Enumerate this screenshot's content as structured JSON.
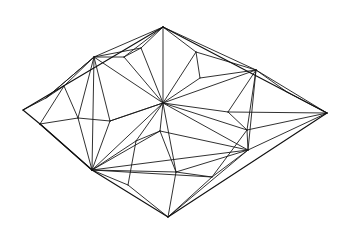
{
  "figure": {
    "kind": "line-drawing",
    "width": 350,
    "height": 240,
    "background_color": "#ffffff",
    "stroke_color": "#1a1a1a",
    "outline_stroke_color": "#111111",
    "stroke_width": 0.9,
    "outline_stroke_width": 1.15
  },
  "chart_data": {
    "type": "diagram",
    "subtype": "planar-graph-triangulation",
    "xlabel": "",
    "ylabel": "",
    "xlim": [
      0,
      350
    ],
    "ylim": [
      0,
      240
    ],
    "grid": false,
    "legend": null,
    "vertices": [
      {
        "id": "L",
        "name": "left-apex",
        "x": 23,
        "y": 110,
        "degree": 4,
        "role": "boundary-corner"
      },
      {
        "id": "T",
        "name": "top-apex",
        "x": 163,
        "y": 27,
        "degree": 8,
        "role": "boundary-corner"
      },
      {
        "id": "R",
        "name": "right-apex",
        "x": 327,
        "y": 113,
        "degree": 8,
        "role": "boundary-corner"
      },
      {
        "id": "B",
        "name": "bottom-apex",
        "x": 168,
        "y": 217,
        "degree": 5,
        "role": "boundary-corner"
      },
      {
        "id": "HUL",
        "name": "hub-upper-left",
        "x": 94,
        "y": 57,
        "degree": 14,
        "role": "hub"
      },
      {
        "id": "HC",
        "name": "hub-center",
        "x": 163,
        "y": 103,
        "degree": 22,
        "role": "hub"
      },
      {
        "id": "HLL",
        "name": "hub-lower-left",
        "x": 92,
        "y": 170,
        "degree": 18,
        "role": "hub"
      },
      {
        "id": "HR",
        "name": "hub-right",
        "x": 248,
        "y": 150,
        "degree": 16,
        "role": "hub"
      },
      {
        "id": "HUR",
        "name": "hub-upper-right",
        "x": 256,
        "y": 70,
        "degree": 10,
        "role": "hub"
      },
      {
        "id": "a1",
        "name": "node-upper-left-low",
        "x": 64,
        "y": 86,
        "degree": 5,
        "role": "interior"
      },
      {
        "id": "a2",
        "name": "node-left-mid",
        "x": 40,
        "y": 124,
        "degree": 4,
        "role": "boundary"
      },
      {
        "id": "a3",
        "name": "node-left-fan-a",
        "x": 78,
        "y": 118,
        "degree": 4,
        "role": "interior"
      },
      {
        "id": "a4",
        "name": "node-left-fan-b",
        "x": 110,
        "y": 121,
        "degree": 4,
        "role": "interior"
      },
      {
        "id": "a5",
        "name": "node-upper-mid-left",
        "x": 124,
        "y": 57,
        "degree": 4,
        "role": "interior"
      },
      {
        "id": "a6",
        "name": "node-upper-mid",
        "x": 141,
        "y": 48,
        "degree": 4,
        "role": "interior"
      },
      {
        "id": "a7",
        "name": "node-upper-right-mid",
        "x": 196,
        "y": 52,
        "degree": 4,
        "role": "interior"
      },
      {
        "id": "a8",
        "name": "node-upper-right-low",
        "x": 200,
        "y": 78,
        "degree": 5,
        "role": "interior"
      },
      {
        "id": "a9",
        "name": "node-center-low",
        "x": 160,
        "y": 131,
        "degree": 5,
        "role": "interior"
      },
      {
        "id": "a10",
        "name": "node-center-left-low",
        "x": 136,
        "y": 141,
        "degree": 4,
        "role": "interior"
      },
      {
        "id": "a11",
        "name": "node-bottom-left",
        "x": 128,
        "y": 185,
        "degree": 3,
        "role": "interior"
      },
      {
        "id": "a12",
        "name": "node-bottom-mid",
        "x": 176,
        "y": 172,
        "degree": 5,
        "role": "interior"
      },
      {
        "id": "a13",
        "name": "node-bottom-right",
        "x": 212,
        "y": 177,
        "degree": 4,
        "role": "interior"
      },
      {
        "id": "a14",
        "name": "node-right-narrow",
        "x": 247,
        "y": 130,
        "degree": 5,
        "role": "interior"
      },
      {
        "id": "a15",
        "name": "node-right-band-up",
        "x": 228,
        "y": 112,
        "degree": 4,
        "role": "interior"
      },
      {
        "id": "a16",
        "name": "node-right-upper-arm",
        "x": 287,
        "y": 92,
        "degree": 3,
        "role": "interior"
      },
      {
        "id": "a17",
        "name": "node-upper-left-edge",
        "x": 46,
        "y": 98,
        "degree": 3,
        "role": "interior"
      }
    ],
    "edges": [
      [
        "L",
        "T"
      ],
      [
        "T",
        "R"
      ],
      [
        "R",
        "B"
      ],
      [
        "B",
        "HLL"
      ],
      [
        "HLL",
        "a2"
      ],
      [
        "a2",
        "L"
      ],
      [
        "L",
        "a17"
      ],
      [
        "a17",
        "HUL"
      ],
      [
        "a17",
        "a1"
      ],
      [
        "a2",
        "a3"
      ],
      [
        "a2",
        "HLL"
      ],
      [
        "T",
        "HUL"
      ],
      [
        "T",
        "a5"
      ],
      [
        "T",
        "a6"
      ],
      [
        "T",
        "HC"
      ],
      [
        "T",
        "a7"
      ],
      [
        "T",
        "HUR"
      ],
      [
        "HUL",
        "a1"
      ],
      [
        "HUL",
        "a3"
      ],
      [
        "HUL",
        "a4"
      ],
      [
        "HUL",
        "a5"
      ],
      [
        "HUL",
        "a6"
      ],
      [
        "HUL",
        "HC"
      ],
      [
        "HUL",
        "HLL"
      ],
      [
        "HUL",
        "a17"
      ],
      [
        "a1",
        "a3"
      ],
      [
        "a1",
        "a2"
      ],
      [
        "a3",
        "a4"
      ],
      [
        "a3",
        "HLL"
      ],
      [
        "a4",
        "HLL"
      ],
      [
        "a4",
        "HC"
      ],
      [
        "a5",
        "a6"
      ],
      [
        "a6",
        "HC"
      ],
      [
        "a5",
        "HC"
      ],
      [
        "a7",
        "HUR"
      ],
      [
        "a7",
        "a8"
      ],
      [
        "a7",
        "HC"
      ],
      [
        "a8",
        "HC"
      ],
      [
        "a8",
        "HUR"
      ],
      [
        "HUR",
        "R"
      ],
      [
        "HUR",
        "a16"
      ],
      [
        "a16",
        "R"
      ],
      [
        "HUR",
        "a15"
      ],
      [
        "HUR",
        "HC"
      ],
      [
        "HUR",
        "a14"
      ],
      [
        "HUR",
        "HR"
      ],
      [
        "HC",
        "a15"
      ],
      [
        "HC",
        "a14"
      ],
      [
        "HC",
        "HR"
      ],
      [
        "HC",
        "a9"
      ],
      [
        "HC",
        "a10"
      ],
      [
        "HC",
        "a12"
      ],
      [
        "HC",
        "HLL"
      ],
      [
        "HC",
        "a4"
      ],
      [
        "a15",
        "a14"
      ],
      [
        "a15",
        "R"
      ],
      [
        "a14",
        "R"
      ],
      [
        "a14",
        "HR"
      ],
      [
        "a14",
        "a13"
      ],
      [
        "R",
        "HR"
      ],
      [
        "HR",
        "a13"
      ],
      [
        "HR",
        "a12"
      ],
      [
        "HR",
        "a9"
      ],
      [
        "HR",
        "HLL"
      ],
      [
        "HR",
        "B"
      ],
      [
        "a9",
        "a10"
      ],
      [
        "a9",
        "a12"
      ],
      [
        "a9",
        "HLL"
      ],
      [
        "a10",
        "HLL"
      ],
      [
        "a10",
        "a11"
      ],
      [
        "a11",
        "HLL"
      ],
      [
        "a11",
        "B"
      ],
      [
        "a12",
        "a13"
      ],
      [
        "a12",
        "B"
      ],
      [
        "a13",
        "B"
      ],
      [
        "HLL",
        "a12"
      ],
      [
        "HLL",
        "a13"
      ]
    ],
    "counts": {
      "vertices": 26,
      "edges": 76,
      "hubs": 5,
      "boundary_corners": 4
    }
  }
}
